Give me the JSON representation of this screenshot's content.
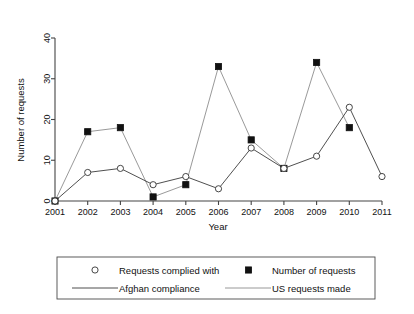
{
  "chart_data": {
    "type": "line",
    "title": "",
    "xlabel": "Year",
    "ylabel": "Number of requests",
    "x": [
      2001,
      2002,
      2003,
      2004,
      2005,
      2006,
      2007,
      2008,
      2009,
      2010,
      2011
    ],
    "categories": [
      "2001",
      "2002",
      "2003",
      "2004",
      "2005",
      "2006",
      "2007",
      "2008",
      "2009",
      "2010",
      "2011"
    ],
    "xlim": [
      2001,
      2011
    ],
    "ylim": [
      0,
      40
    ],
    "yticks": [
      0,
      10,
      20,
      30,
      40
    ],
    "ytick_labels": [
      "0",
      "10",
      "20",
      "30",
      "40"
    ],
    "xtick_labels": [
      "2001",
      "2002",
      "2003",
      "2004",
      "2005",
      "2006",
      "2007",
      "2008",
      "2009",
      "2010",
      "2011"
    ],
    "grid": false,
    "legend_position": "below",
    "series": [
      {
        "name": "Requests complied with",
        "line_name": "Afghan compliance",
        "marker": "circle",
        "color": "#3b3b3b",
        "values": [
          0,
          7,
          8,
          4,
          6,
          3,
          13,
          8,
          11,
          23,
          6
        ]
      },
      {
        "name": "Number of requests",
        "line_name": "US requests made",
        "marker": "square",
        "color": "#8d8d8d",
        "values": [
          0,
          17,
          18,
          1,
          4,
          33,
          15,
          8,
          34,
          18,
          null
        ]
      }
    ]
  },
  "legend": {
    "entries": [
      {
        "label": "Requests complied with",
        "glyph": "circle-marker"
      },
      {
        "label": "Number of requests",
        "glyph": "square-marker"
      },
      {
        "label": "Afghan compliance",
        "glyph": "dark-line"
      },
      {
        "label": "US requests made",
        "glyph": "gray-line"
      }
    ]
  },
  "axes": {
    "y_title": "Number of requests",
    "x_title": "Year"
  }
}
